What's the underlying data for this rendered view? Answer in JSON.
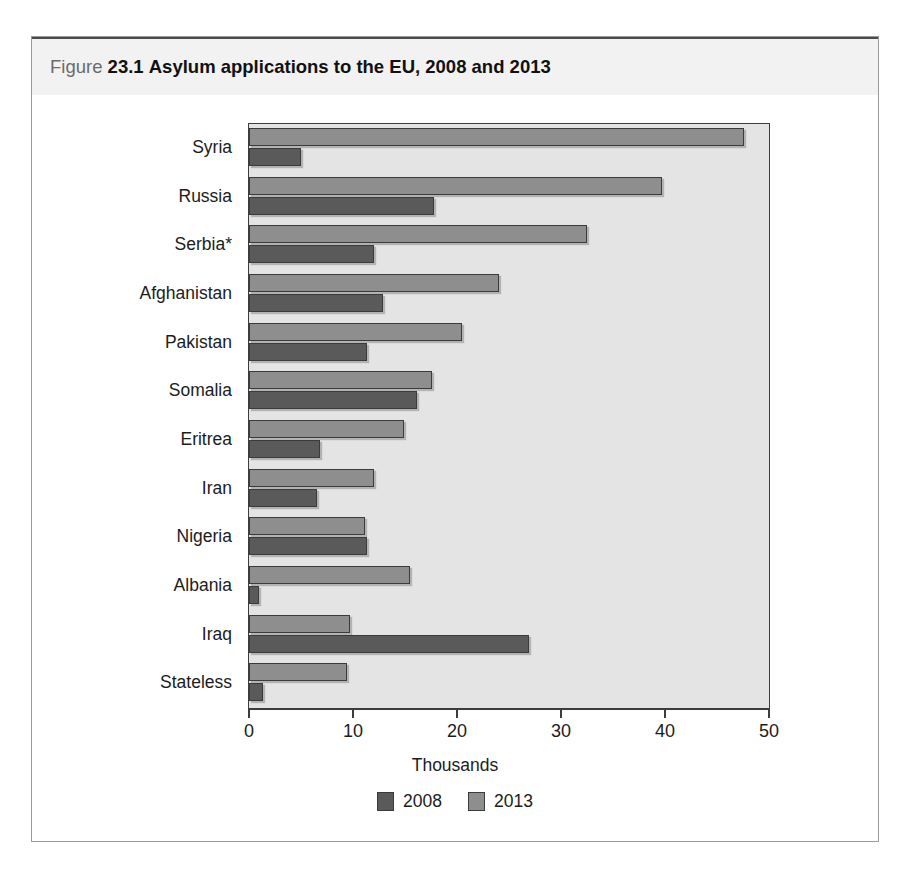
{
  "figure": {
    "label_word": "Figure",
    "number": "23.1",
    "title": "Asylum applications to the EU, 2008 and 2013"
  },
  "chart_data": {
    "type": "bar",
    "orientation": "horizontal",
    "title": "Asylum applications to the EU, 2008 and 2013",
    "xlabel": "Thousands",
    "ylabel": "",
    "xlim": [
      0,
      50
    ],
    "xticks": [
      0,
      10,
      20,
      30,
      40,
      50
    ],
    "xtick_labels": [
      "0",
      "10",
      "20",
      "30",
      "40",
      "50"
    ],
    "grid": false,
    "legend_position": "bottom",
    "categories": [
      "Syria",
      "Russia",
      "Serbia*",
      "Afghanistan",
      "Pakistan",
      "Somalia",
      "Eritrea",
      "Iran",
      "Nigeria",
      "Albania",
      "Iraq",
      "Stateless"
    ],
    "series": [
      {
        "name": "2008",
        "color": "#5a5a5a",
        "values": [
          5.0,
          17.8,
          12.0,
          12.9,
          11.3,
          16.2,
          6.8,
          6.5,
          11.3,
          1.0,
          26.9,
          1.3
        ]
      },
      {
        "name": "2013",
        "color": "#8e8e8e",
        "values": [
          47.6,
          39.7,
          32.5,
          24.0,
          20.5,
          17.6,
          14.9,
          12.0,
          11.2,
          15.5,
          9.7,
          9.4
        ]
      }
    ],
    "legend": [
      "2008",
      "2013"
    ]
  },
  "colors": {
    "bar_2008": "#5a5a5a",
    "bar_2013": "#8e8e8e",
    "plot_background": "#e4e4e4",
    "header_band": "#f2f2f2",
    "frame_border": "#9a9a9a"
  }
}
